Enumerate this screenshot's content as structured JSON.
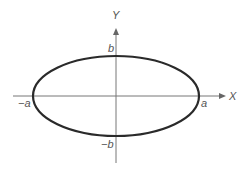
{
  "diagram": {
    "type": "ellipse",
    "colors": {
      "curve": "#2a2a2a",
      "axes": "#777777",
      "labels": "#555555",
      "background": "#ffffff"
    },
    "axes": {
      "x_label": "X",
      "y_label": "Y"
    },
    "labels": {
      "pos_a": "a",
      "neg_a": "−a",
      "pos_b": "b",
      "neg_b": "−b"
    }
  }
}
